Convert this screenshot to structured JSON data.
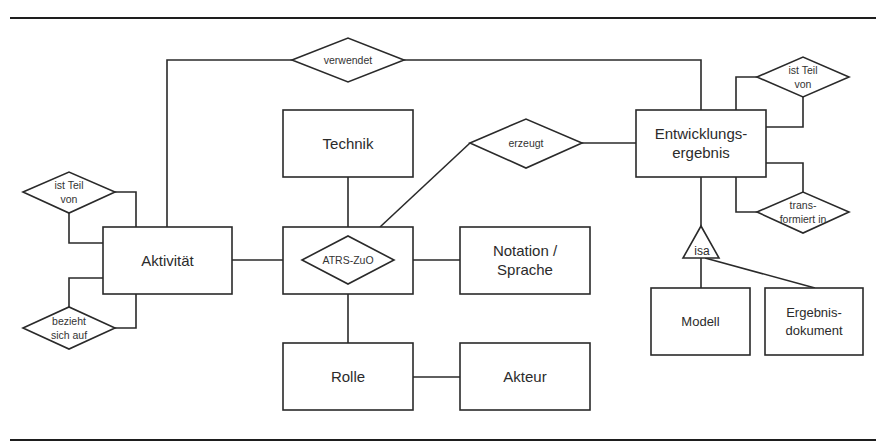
{
  "figure": {
    "type": "entity-relationship diagram",
    "colors": {
      "line": "#2a2a2a",
      "background": "#ffffff",
      "text": "#2b2b2b"
    }
  },
  "entities": {
    "aktivitaet": {
      "label": "Aktivität"
    },
    "technik": {
      "label": "Technik"
    },
    "entwicklungsergebnis": {
      "line1": "Entwicklungs-",
      "line2": "ergebnis"
    },
    "atrs_zuo_box": {
      "label": "ATRS-ZuO"
    },
    "notation": {
      "line1": "Notation /",
      "line2": "Sprache"
    },
    "rolle": {
      "label": "Rolle"
    },
    "akteur": {
      "label": "Akteur"
    },
    "modell": {
      "label": "Modell"
    },
    "ergebnisdokument": {
      "line1": "Ergebnis-",
      "line2": "dokument"
    }
  },
  "relationships": {
    "verwendet": {
      "label": "verwendet"
    },
    "erzeugt": {
      "label": "erzeugt"
    },
    "atrs_zuo": {
      "label": "ATRS-ZuO"
    },
    "ist_teil_von_left": {
      "line1": "ist Teil",
      "line2": "von"
    },
    "bezieht_sich_auf": {
      "line1": "bezieht",
      "line2": "sich auf"
    },
    "ist_teil_von_right": {
      "line1": "ist Teil",
      "line2": "von"
    },
    "transformiert_in": {
      "line1": "trans-",
      "line2": "formiert in"
    }
  },
  "generalization": {
    "label": "isa"
  }
}
